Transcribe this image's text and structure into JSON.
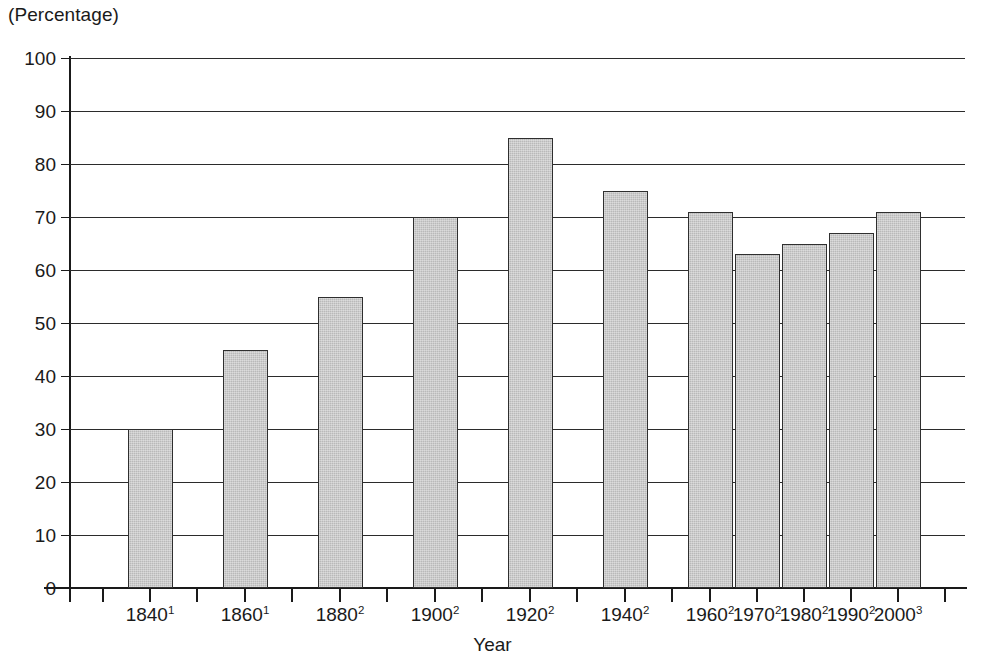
{
  "chart_data": {
    "type": "bar",
    "title": "",
    "subtitle": "",
    "unit_label": "(Percentage)",
    "xlabel": "Year",
    "ylabel": "",
    "ylim": [
      0,
      100
    ],
    "grid": true,
    "legend": "none",
    "y_ticks": [
      100,
      90,
      80,
      70,
      60,
      50,
      40,
      30,
      20,
      10,
      0
    ],
    "y_tick_labels": [
      "100",
      "90",
      "80",
      "70",
      "60",
      "50",
      "40",
      "30",
      "20",
      "10",
      "0"
    ],
    "categories": [
      "1840",
      "1860",
      "1880",
      "1900",
      "1920",
      "1940",
      "1960",
      "1970",
      "1980",
      "1990",
      "2000"
    ],
    "category_footnotes": [
      "1",
      "1",
      "2",
      "2",
      "2",
      "2",
      "2",
      "2",
      "2",
      "2",
      "3"
    ],
    "x_tick_labels": [
      "1840¹",
      "1860¹",
      "1880²",
      "1900²",
      "1920²",
      "1940²",
      "1960²",
      "1970²",
      "1980²",
      "1990²",
      "2000³"
    ],
    "values": [
      30,
      45,
      55,
      70,
      85,
      75,
      71,
      63,
      65,
      67,
      71
    ],
    "bar_fill_color": "#b9b9b9",
    "bar_edge_color": "#2f2f2f",
    "axis_color": "#1a1a1a",
    "background_color": "#ffffff"
  },
  "bars": [
    {
      "label": "1840",
      "sup": "1",
      "value": 30,
      "left": 128,
      "width": 45,
      "tick_x": 150
    },
    {
      "label": "1860",
      "sup": "1",
      "value": 45,
      "left": 223,
      "width": 45,
      "tick_x": 245
    },
    {
      "label": "1880",
      "sup": "2",
      "value": 55,
      "left": 318,
      "width": 45,
      "tick_x": 340
    },
    {
      "label": "1900",
      "sup": "2",
      "value": 70,
      "left": 413,
      "width": 45,
      "tick_x": 435
    },
    {
      "label": "1920",
      "sup": "2",
      "value": 85,
      "left": 508,
      "width": 45,
      "tick_x": 530
    },
    {
      "label": "1940",
      "sup": "2",
      "value": 75,
      "left": 603,
      "width": 45,
      "tick_x": 625
    },
    {
      "label": "1960",
      "sup": "2",
      "value": 71,
      "left": 688,
      "width": 45,
      "tick_x": 710
    },
    {
      "label": "1970",
      "sup": "2",
      "value": 63,
      "left": 735,
      "width": 45,
      "tick_x": 757
    },
    {
      "label": "1980",
      "sup": "2",
      "value": 65,
      "left": 782,
      "width": 45,
      "tick_x": 804
    },
    {
      "label": "1990",
      "sup": "2",
      "value": 67,
      "left": 829,
      "width": 45,
      "tick_x": 851
    },
    {
      "label": "2000",
      "sup": "3",
      "value": 71,
      "left": 876,
      "width": 45,
      "tick_x": 898
    }
  ],
  "x_axis_ticks": [
    70,
    103,
    150,
    197,
    245,
    292,
    340,
    387,
    435,
    482,
    530,
    577,
    625,
    672,
    710,
    757,
    804,
    851,
    898,
    945
  ]
}
